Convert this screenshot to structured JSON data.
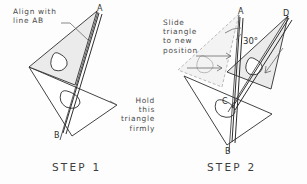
{
  "figure": {
    "title_hidden": "Drafting triangle alignment procedure",
    "background_color": "#fdfdfd",
    "ink_color": "#2e2e2e",
    "annotation_color": "#4a4a4a",
    "shade_color": "#e9e9e9"
  },
  "steps": [
    {
      "id": "step1",
      "label": "STEP  1",
      "annotations": [
        {
          "name": "align-note",
          "text": "Align with\nline AB"
        },
        {
          "name": "hold-note",
          "text": "Hold\nthis\ntriangle\nfirmly"
        }
      ],
      "point_labels": [
        {
          "name": "point-a",
          "text": "A"
        },
        {
          "name": "point-b",
          "text": "B"
        }
      ]
    },
    {
      "id": "step2",
      "label": "STEP  2",
      "annotations": [
        {
          "name": "slide-note",
          "text": "Slide\ntriangle\nto  new\nposition"
        }
      ],
      "point_labels": [
        {
          "name": "point-a",
          "text": "A"
        },
        {
          "name": "point-d",
          "text": "D"
        },
        {
          "name": "point-b",
          "text": "B"
        },
        {
          "name": "point-c",
          "text": "C"
        }
      ],
      "angle_labels": [
        {
          "name": "angle-30",
          "text": "30°"
        }
      ]
    }
  ]
}
